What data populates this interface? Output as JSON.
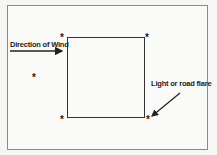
{
  "diagram": {
    "wind_label": "Direction of Wind",
    "flare_label": "Light or road flare",
    "star_glyph": "*",
    "markers": [
      {
        "id": "top-left",
        "x": 60,
        "y": 33
      },
      {
        "id": "top-right",
        "x": 145,
        "y": 33
      },
      {
        "id": "bottom-left",
        "x": 60,
        "y": 117
      },
      {
        "id": "bottom-right",
        "x": 145,
        "y": 117
      },
      {
        "id": "upwind",
        "x": 32,
        "y": 73
      }
    ]
  }
}
